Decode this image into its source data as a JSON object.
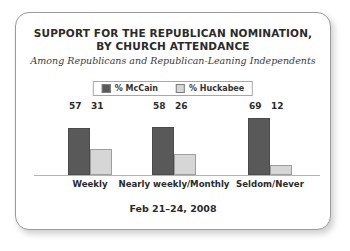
{
  "card": {
    "title_lines": [
      "SUPPORT FOR THE REPUBLICAN NOMINATION,",
      "BY CHURCH ATTENDANCE"
    ],
    "subtitle": "Among Republicans and Republican-Leaning Independents",
    "footer_date": "Feb 21–24, 2008"
  },
  "legend": {
    "entries": [
      {
        "label": "% McCain",
        "color": "#595959"
      },
      {
        "label": "% Huckabee",
        "color": "#d6d6d6"
      }
    ]
  },
  "chart_data": {
    "type": "bar",
    "title": "SUPPORT FOR THE REPUBLICAN NOMINATION, BY CHURCH ATTENDANCE",
    "subtitle": "Among Republicans and Republican-Leaning Independents",
    "annotation": "Feb 21–24, 2008",
    "xlabel": "",
    "ylabel": "",
    "ylim": [
      0,
      75
    ],
    "grid": false,
    "legend_position": "top-center",
    "categories": [
      "Weekly",
      "Nearly weekly/Monthly",
      "Seldom/Never"
    ],
    "series": [
      {
        "name": "% McCain",
        "color": "#595959",
        "values": [
          57,
          58,
          69
        ]
      },
      {
        "name": "% Huckabee",
        "color": "#d6d6d6",
        "values": [
          31,
          26,
          12
        ]
      }
    ]
  }
}
